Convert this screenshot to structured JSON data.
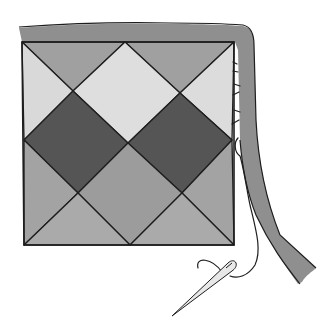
{
  "illustration": {
    "alt": "Quilt block with binding strip being hand-stitched, needle and thread",
    "colors": {
      "background": "#ffffff",
      "outline": "#1e1e1e",
      "binding": "#8f8f8f",
      "light_patch": "#d8d8d8",
      "medium_patch": "#9a9a9a",
      "medium_light_patch": "#a8a8a8",
      "dark_patch": "#555555",
      "needle": "#e8e8e8"
    },
    "elements": [
      "binding-strip",
      "quilt-block",
      "dark-diamond-left",
      "dark-diamond-right",
      "light-diamond-top",
      "whip-stitches",
      "thread",
      "needle"
    ]
  }
}
